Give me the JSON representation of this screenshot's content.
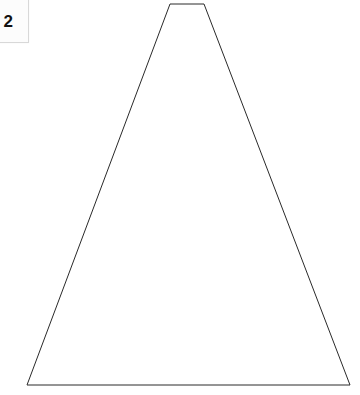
{
  "canvas": {
    "width": 360,
    "height": 395,
    "background_color": "#ffffff"
  },
  "label_card": {
    "text": "2",
    "background_color": "#fcfcfc",
    "border_color": "#d8d8d8",
    "text_color": "#111111"
  },
  "figure": {
    "shape_name": "trapezoid-outline",
    "stroke_color": "#2a2a2a",
    "stroke_width": 1,
    "fill": "none",
    "points": "170,4 204,4 350,385 27,385",
    "vertices": [
      {
        "name": "top-left",
        "x": 170,
        "y": 4
      },
      {
        "name": "top-right",
        "x": 204,
        "y": 4
      },
      {
        "name": "bottom-right",
        "x": 350,
        "y": 385
      },
      {
        "name": "bottom-left",
        "x": 27,
        "y": 385
      }
    ]
  }
}
